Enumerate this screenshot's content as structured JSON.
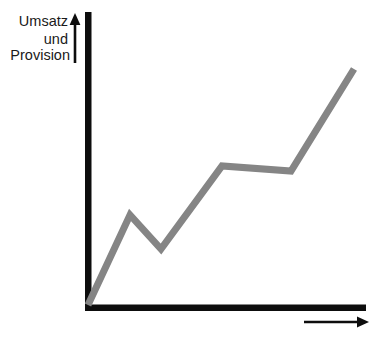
{
  "chart_data": {
    "type": "line",
    "title": "",
    "subtitle": "",
    "ylabel_lines": [
      "Umsatz",
      "und",
      "Provision"
    ],
    "ylabel": "Umsatz und Provision",
    "xlabel": "",
    "grid": false,
    "legend": null,
    "axis_ticks": {
      "x": [],
      "y": []
    },
    "axis_ranges": {
      "x": [
        0,
        100
      ],
      "y": [
        0,
        100
      ]
    },
    "series": [
      {
        "name": "Umsatz und Provision",
        "color": "#858585",
        "line_width_px": 7,
        "points_px": [
          [
            88,
            305
          ],
          [
            130,
            215
          ],
          [
            161,
            249
          ],
          [
            222,
            166
          ],
          [
            291,
            171
          ],
          [
            354,
            69
          ]
        ],
        "x": [
          0,
          15.1,
          26.3,
          48.3,
          73.1,
          95.7
        ],
        "values": [
          0,
          38.4,
          23.9,
          59.2,
          57.1,
          100.6
        ]
      }
    ],
    "annotations": [
      {
        "name": "y-axis-direction-arrow",
        "direction": "up"
      },
      {
        "name": "x-axis-direction-arrow",
        "direction": "right"
      }
    ],
    "colors": {
      "line": "#858585",
      "axis": "#0d0d0d",
      "arrow": "#0d0d0d",
      "text": "#1a1a1a",
      "background": "#ffffff"
    }
  },
  "axes": {
    "y_axis_name": "vertical-axis",
    "x_axis_name": "horizontal-axis"
  }
}
